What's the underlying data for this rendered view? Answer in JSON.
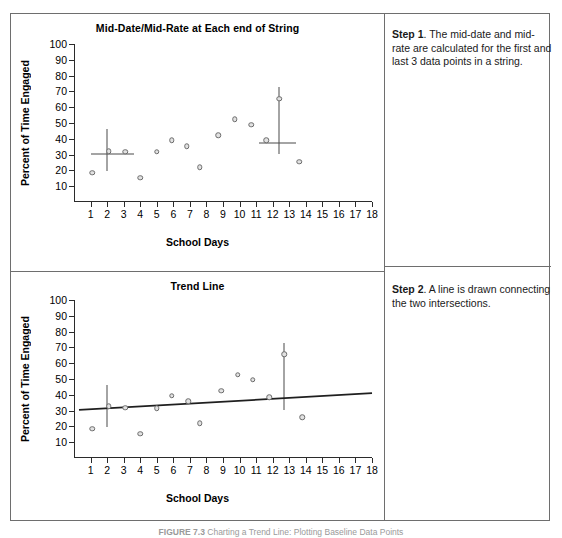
{
  "figure": {
    "caption_label": "FIGURE 7.3",
    "caption_text": "Charting a Trend Line: Plotting Baseline Data Points"
  },
  "steps": [
    {
      "label": "Step 1",
      "text": ". The mid-date and mid-rate are calculated for the first and last 3 data points in a string."
    },
    {
      "label": "Step 2",
      "text": ". A line is drawn connecting the two intersections."
    }
  ],
  "chart_data": [
    {
      "type": "scatter",
      "title": "Mid-Date/Mid-Rate at Each end of String",
      "xlabel": "School Days",
      "ylabel": "Percent of Time Engaged",
      "xlim": [
        0,
        18
      ],
      "ylim": [
        0,
        100
      ],
      "xticks": [
        1,
        2,
        3,
        4,
        5,
        6,
        7,
        8,
        9,
        10,
        11,
        12,
        13,
        14,
        15,
        16,
        17,
        18
      ],
      "yticks": [
        10,
        20,
        30,
        40,
        50,
        60,
        70,
        80,
        90,
        100
      ],
      "grid": false,
      "legend": "none",
      "points": [
        {
          "x": 1.1,
          "y": 18.5
        },
        {
          "x": 2.1,
          "y": 32.0
        },
        {
          "x": 3.1,
          "y": 31.8
        },
        {
          "x": 4.0,
          "y": 15.2
        },
        {
          "x": 5.0,
          "y": 31.8
        },
        {
          "x": 5.9,
          "y": 39.0
        },
        {
          "x": 6.8,
          "y": 35.4
        },
        {
          "x": 7.6,
          "y": 22.0
        },
        {
          "x": 8.7,
          "y": 42.3
        },
        {
          "x": 9.7,
          "y": 52.5
        },
        {
          "x": 10.7,
          "y": 49.0
        },
        {
          "x": 11.6,
          "y": 39.0
        },
        {
          "x": 12.4,
          "y": 65.5
        },
        {
          "x": 13.6,
          "y": 25.5
        }
      ],
      "annotations": [
        {
          "name": "left-mid-date-vertical",
          "x": 2.0,
          "y0": 19.8,
          "y1": 46.5
        },
        {
          "name": "left-mid-rate-horizontal",
          "y": 30.5,
          "x0": 1.0,
          "x1": 3.6
        },
        {
          "name": "right-mid-date-vertical",
          "x": 12.4,
          "y0": 30.3,
          "y1": 72.5
        },
        {
          "name": "right-mid-rate-horizontal",
          "y": 37.3,
          "x0": 11.2,
          "x1": 13.4
        }
      ]
    },
    {
      "type": "scatter",
      "title": "Trend Line",
      "xlabel": "School Days",
      "ylabel": "Percent of Time Engaged",
      "xlim": [
        0,
        18
      ],
      "ylim": [
        0,
        100
      ],
      "xticks": [
        1,
        2,
        3,
        4,
        5,
        6,
        7,
        8,
        9,
        10,
        11,
        12,
        13,
        14,
        15,
        16,
        17,
        18
      ],
      "yticks": [
        10,
        20,
        30,
        40,
        50,
        60,
        70,
        80,
        90,
        100
      ],
      "grid": false,
      "legend": "none",
      "points": [
        {
          "x": 1.1,
          "y": 18.5
        },
        {
          "x": 2.1,
          "y": 32.8
        },
        {
          "x": 3.1,
          "y": 31.8
        },
        {
          "x": 4.0,
          "y": 15.2
        },
        {
          "x": 5.0,
          "y": 31.6
        },
        {
          "x": 5.9,
          "y": 39.3
        },
        {
          "x": 6.9,
          "y": 35.8
        },
        {
          "x": 7.6,
          "y": 22.0
        },
        {
          "x": 8.9,
          "y": 42.5
        },
        {
          "x": 9.9,
          "y": 52.7
        },
        {
          "x": 10.8,
          "y": 49.5
        },
        {
          "x": 11.8,
          "y": 38.6
        },
        {
          "x": 12.7,
          "y": 65.8
        },
        {
          "x": 13.8,
          "y": 25.8
        }
      ],
      "trend_line": {
        "x0": 0.3,
        "y0": 30.4,
        "x1": 18.0,
        "y1": 41.0
      },
      "annotations": [
        {
          "name": "left-mid-date-vertical",
          "x": 2.0,
          "y0": 19.8,
          "y1": 46.5
        },
        {
          "name": "right-mid-date-vertical",
          "x": 12.7,
          "y0": 30.3,
          "y1": 72.5
        }
      ]
    }
  ]
}
